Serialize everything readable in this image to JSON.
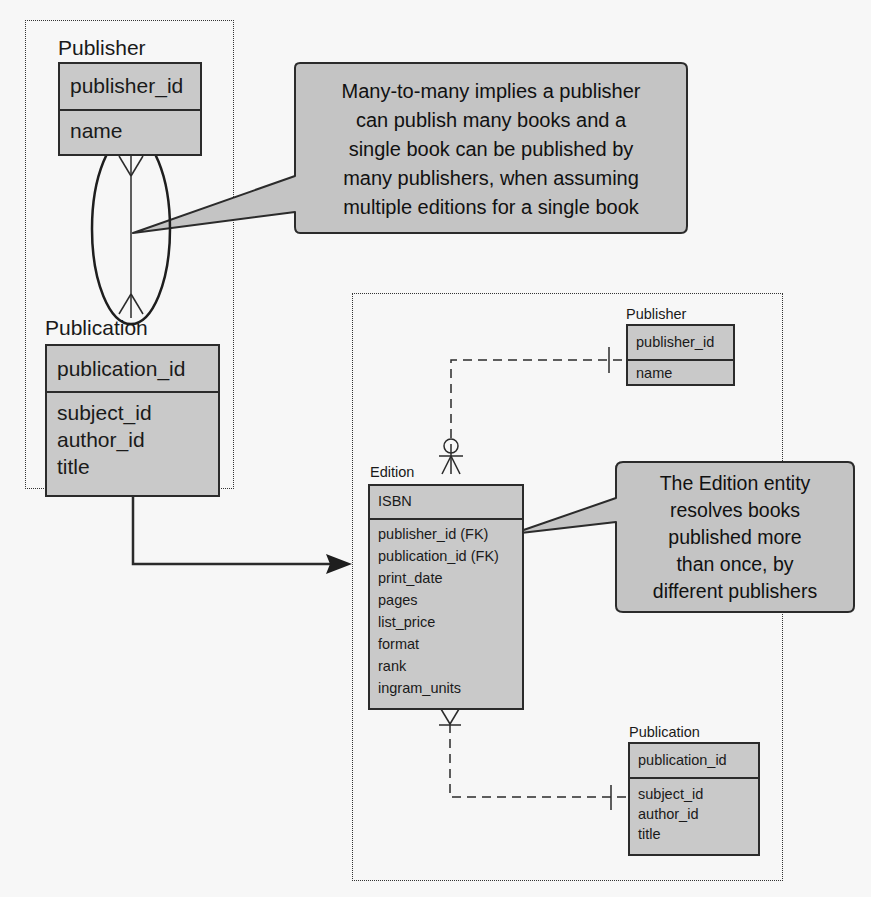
{
  "left_group": {
    "publisher": {
      "title": "Publisher",
      "primary_key": "publisher_id",
      "attributes": [
        "name"
      ]
    },
    "publication": {
      "title": "Publication",
      "primary_key": "publication_id",
      "attributes": [
        "subject_id",
        "author_id",
        "title"
      ]
    },
    "relationship": "many-to-many"
  },
  "callout_many_to_many": {
    "lines": [
      "Many-to-many implies a publisher",
      "can publish many books and a",
      "single book can be published by",
      "many publishers, when assuming",
      "multiple editions for a single book"
    ]
  },
  "right_group": {
    "publisher": {
      "title": "Publisher",
      "primary_key": "publisher_id",
      "attributes": [
        "name"
      ]
    },
    "edition": {
      "title": "Edition",
      "primary_key": "ISBN",
      "attributes": [
        "publisher_id (FK)",
        "publication_id (FK)",
        "print_date",
        "pages",
        "list_price",
        "format",
        "rank",
        "ingram_units"
      ]
    },
    "publication": {
      "title": "Publication",
      "primary_key": "publication_id",
      "attributes": [
        "subject_id",
        "author_id",
        "title"
      ]
    }
  },
  "callout_edition": {
    "lines": [
      "The Edition entity",
      "resolves books",
      "published more",
      "than once, by",
      "different publishers"
    ]
  },
  "colors": {
    "entity_fill": "#c9c9c9",
    "callout_fill": "#c4c4c4",
    "line": "#2b2b2b",
    "background": "#f7f7f7"
  }
}
